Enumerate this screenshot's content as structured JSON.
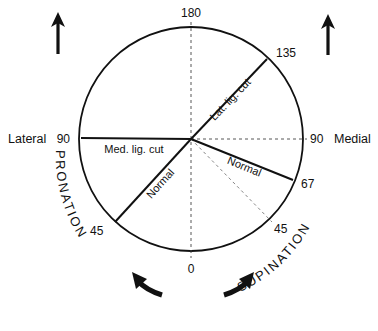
{
  "diagram": {
    "center": [
      191,
      139
    ],
    "radius": 112,
    "angle_labels": {
      "top": "180",
      "upper_right": "135",
      "left": "90",
      "right": "90",
      "right_lower": "67",
      "lower_left": "45",
      "lower_right": "45",
      "bottom": "0"
    },
    "side_labels": {
      "left": "Lateral",
      "right": "Medial"
    },
    "line_labels": {
      "lat_lig_cut": "Lat. lig. cut",
      "med_lig_cut": "Med. lig. cut",
      "normal_left": "Normal",
      "normal_right": "Normal"
    },
    "rotation_labels": {
      "left": "PRONATION",
      "right": "SUPINATION"
    },
    "colors": {
      "stroke": "#111111",
      "dashed": "#444444",
      "background": "#ffffff"
    }
  }
}
